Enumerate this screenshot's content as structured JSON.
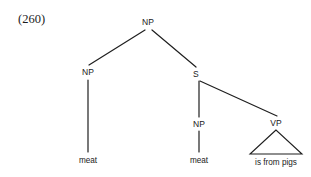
{
  "figure": {
    "example_number": "(260)",
    "background_color": "#ffffff",
    "line_color": "#1f1f1f",
    "text_color": "#1a1a1a"
  },
  "tree": {
    "nodes": [
      {
        "id": "root-np",
        "label": "NP",
        "x": 148,
        "y": 22,
        "type": "nonterminal"
      },
      {
        "id": "left-np",
        "label": "NP",
        "x": 88,
        "y": 72,
        "type": "nonterminal"
      },
      {
        "id": "s-node",
        "label": "S",
        "x": 196,
        "y": 74,
        "type": "nonterminal"
      },
      {
        "id": "inner-np",
        "label": "NP",
        "x": 199,
        "y": 124,
        "type": "nonterminal"
      },
      {
        "id": "vp-node",
        "label": "VP",
        "x": 276,
        "y": 123,
        "type": "nonterminal"
      }
    ],
    "terminals": [
      {
        "id": "terminal-meat-left",
        "label": "meat",
        "x": 88,
        "y": 160
      },
      {
        "id": "terminal-meat-inner",
        "label": "meat",
        "x": 199,
        "y": 160
      },
      {
        "id": "terminal-is-from-pigs",
        "label": "is from pigs",
        "x": 276,
        "y": 162
      }
    ],
    "edges": [
      {
        "id": "edge-root-to-left-np",
        "x1": 145,
        "y1": 30,
        "x2": 89,
        "y2": 65
      },
      {
        "id": "edge-root-to-s",
        "x1": 152,
        "y1": 30,
        "x2": 196,
        "y2": 67
      },
      {
        "id": "edge-left-np-to-meat",
        "x1": 88,
        "y1": 80,
        "x2": 88,
        "y2": 152
      },
      {
        "id": "edge-s-to-inner-np",
        "x1": 199,
        "y1": 81,
        "x2": 199,
        "y2": 117
      },
      {
        "id": "edge-s-to-vp",
        "x1": 200,
        "y1": 81,
        "x2": 277,
        "y2": 116
      },
      {
        "id": "edge-inner-np-to-meat",
        "x1": 199,
        "y1": 131,
        "x2": 199,
        "y2": 152
      }
    ],
    "triangle": {
      "id": "vp-triangle",
      "apex_x": 276,
      "apex_y": 130,
      "left_x": 250,
      "left_y": 154,
      "right_x": 302,
      "right_y": 154
    }
  }
}
